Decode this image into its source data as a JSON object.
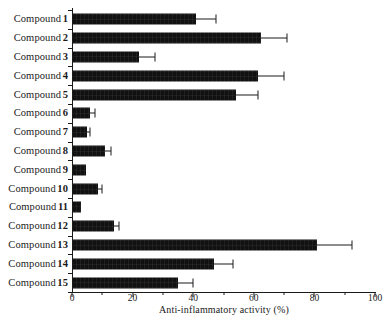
{
  "chart_data": {
    "type": "bar",
    "orientation": "horizontal",
    "title": "",
    "xlabel": "Anti-inflammatory activity  (%)",
    "ylabel": "",
    "xlim": [
      0,
      100
    ],
    "xticks": [
      0,
      20,
      40,
      60,
      80,
      100
    ],
    "xticklabels": [
      "0",
      "20",
      "40",
      "60",
      "80",
      "100"
    ],
    "minor_tick_interval": 10,
    "grid": false,
    "legend": null,
    "bar_color": "#111111",
    "categories": [
      "Compound 1",
      "Compound 2",
      "Compound 3",
      "Compound 4",
      "Compound 5",
      "Compound 6",
      "Compound 7",
      "Compound 8",
      "Compound 9",
      "Compound 10",
      "Compound 11",
      "Compound 12",
      "Compound 13",
      "Compound 14",
      "Compound 15"
    ],
    "category_prefix": "Compound",
    "category_numbers": [
      "1",
      "2",
      "3",
      "4",
      "5",
      "6",
      "7",
      "8",
      "9",
      "10",
      "11",
      "12",
      "13",
      "14",
      "15"
    ],
    "values": [
      41,
      62.5,
      22,
      61.5,
      54,
      6,
      5,
      11,
      4.5,
      8.5,
      3,
      14,
      81,
      47,
      35
    ],
    "errors": [
      6.5,
      8.5,
      5.5,
      8.5,
      7.5,
      1.5,
      1,
      2,
      0,
      1.5,
      0,
      1.5,
      11.5,
      6,
      5
    ]
  }
}
